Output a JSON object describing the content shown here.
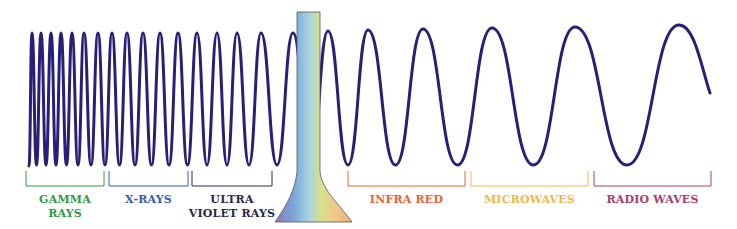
{
  "diagram": {
    "wave_color": "#2a1f78",
    "bands": [
      {
        "id": "gamma",
        "line1": "GAMMA",
        "line2": "RAYS",
        "color": "#2e9a4a",
        "x1": 26,
        "x2": 104
      },
      {
        "id": "xrays",
        "line1": "X-RAYS",
        "line2": "",
        "color": "#3a5ab8",
        "x1": 109,
        "x2": 188
      },
      {
        "id": "uv",
        "line1": "ULTRA",
        "line2": "VIOLET RAYS",
        "color": "#2a2a4a",
        "x1": 192,
        "x2": 272
      },
      {
        "id": "infrared",
        "line1": "INFRA RED",
        "line2": "",
        "color": "#e8643a",
        "x1": 348,
        "x2": 465
      },
      {
        "id": "microwaves",
        "line1": "MICROWAVES",
        "line2": "",
        "color": "#f0b84a",
        "x1": 471,
        "x2": 588
      },
      {
        "id": "radio",
        "line1": "RADIO WAVES",
        "line2": "",
        "color": "#a8406a",
        "x1": 594,
        "x2": 711
      }
    ],
    "visible_light": {
      "label": "Visible light prism",
      "colors": [
        "#8a7ab8",
        "#7aa8d8",
        "#a8d0e0",
        "#d8e08a",
        "#f0c88a",
        "#f0a870"
      ]
    }
  }
}
